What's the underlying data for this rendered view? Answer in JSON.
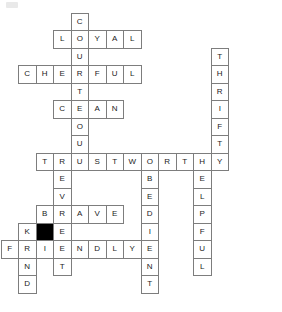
{
  "puzzle": {
    "title": "Scout Law Crossword Grid",
    "grid": {
      "cell_size": 17.5,
      "origin_x": 0.5,
      "origin_y": 12.5,
      "columns": 16,
      "rows": 17
    },
    "colors": {
      "cell_border": "#7d7d7d",
      "cell_fill": "#ffffff",
      "blocked_fill": "#000000",
      "letter": "#1b1b1b",
      "page_background": "#ffffff",
      "corner_mark": "#e9e9e9"
    },
    "entries": [
      {
        "id": "courteous-down",
        "answer": "COURTEOUS",
        "direction": "down",
        "row": 0,
        "col": 4
      },
      {
        "id": "loyal-across",
        "answer": "LOYAL",
        "direction": "across",
        "row": 1,
        "col": 3
      },
      {
        "id": "cheerful-across",
        "answer": "CHEERFUL",
        "direction": "across",
        "row": 3,
        "col": 1
      },
      {
        "id": "thrifty-down",
        "answer": "THRIFTY",
        "direction": "down",
        "row": 2,
        "col": 12
      },
      {
        "id": "clean-across",
        "answer": "CLEAN",
        "direction": "across",
        "row": 5,
        "col": 3
      },
      {
        "id": "trustworthy-across",
        "answer": "TRUSTWORTHY",
        "direction": "across",
        "row": 8,
        "col": 2
      },
      {
        "id": "event-down",
        "answer": "EVENT",
        "direction": "down",
        "row": 8,
        "col": 3
      },
      {
        "id": "obedient-down",
        "answer": "OBEDIENT",
        "direction": "down",
        "row": 8,
        "col": 8
      },
      {
        "id": "helpful-down",
        "answer": "HELPFUL",
        "direction": "down",
        "row": 8,
        "col": 11
      },
      {
        "id": "brave-across",
        "answer": "BRAVE",
        "direction": "across",
        "row": 11,
        "col": 2
      },
      {
        "id": "kind-down",
        "answer": "KIND",
        "direction": "down",
        "row": 12,
        "col": 1
      },
      {
        "id": "friendly-across",
        "answer": "FRIENDLY",
        "direction": "across",
        "row": 13,
        "col": 0
      }
    ],
    "blocked_cells": [
      {
        "row": 12,
        "col": 2
      }
    ],
    "letters": [
      {
        "row": 0,
        "col": 4,
        "letter": "C"
      },
      {
        "row": 1,
        "col": 3,
        "letter": "L"
      },
      {
        "row": 1,
        "col": 4,
        "letter": "O"
      },
      {
        "row": 1,
        "col": 5,
        "letter": "Y"
      },
      {
        "row": 1,
        "col": 6,
        "letter": "A"
      },
      {
        "row": 1,
        "col": 7,
        "letter": "L"
      },
      {
        "row": 2,
        "col": 4,
        "letter": "U"
      },
      {
        "row": 2,
        "col": 12,
        "letter": "T"
      },
      {
        "row": 3,
        "col": 1,
        "letter": "C"
      },
      {
        "row": 3,
        "col": 2,
        "letter": "H"
      },
      {
        "row": 3,
        "col": 3,
        "letter": "E"
      },
      {
        "row": 3,
        "col": 4,
        "letter": "R"
      },
      {
        "row": 3,
        "col": 5,
        "letter": "F"
      },
      {
        "row": 3,
        "col": 6,
        "letter": "U"
      },
      {
        "row": 3,
        "col": 7,
        "letter": "L"
      },
      {
        "row": 3,
        "col": 12,
        "letter": "H"
      },
      {
        "row": 4,
        "col": 4,
        "letter": "T"
      },
      {
        "row": 4,
        "col": 12,
        "letter": "R"
      },
      {
        "row": 5,
        "col": 3,
        "letter": "C"
      },
      {
        "row": 5,
        "col": 4,
        "letter": "E"
      },
      {
        "row": 5,
        "col": 5,
        "letter": "A"
      },
      {
        "row": 5,
        "col": 6,
        "letter": "N"
      },
      {
        "row": 5,
        "col": 12,
        "letter": "I"
      },
      {
        "row": 6,
        "col": 4,
        "letter": "O"
      },
      {
        "row": 6,
        "col": 12,
        "letter": "F"
      },
      {
        "row": 7,
        "col": 4,
        "letter": "U"
      },
      {
        "row": 7,
        "col": 12,
        "letter": "T"
      },
      {
        "row": 8,
        "col": 2,
        "letter": "T"
      },
      {
        "row": 8,
        "col": 3,
        "letter": "R"
      },
      {
        "row": 8,
        "col": 4,
        "letter": "U"
      },
      {
        "row": 8,
        "col": 5,
        "letter": "S"
      },
      {
        "row": 8,
        "col": 6,
        "letter": "T"
      },
      {
        "row": 8,
        "col": 7,
        "letter": "W"
      },
      {
        "row": 8,
        "col": 8,
        "letter": "O"
      },
      {
        "row": 8,
        "col": 9,
        "letter": "R"
      },
      {
        "row": 8,
        "col": 10,
        "letter": "T"
      },
      {
        "row": 8,
        "col": 11,
        "letter": "H"
      },
      {
        "row": 8,
        "col": 12,
        "letter": "Y"
      },
      {
        "row": 9,
        "col": 3,
        "letter": "E"
      },
      {
        "row": 9,
        "col": 8,
        "letter": "B"
      },
      {
        "row": 9,
        "col": 11,
        "letter": "E"
      },
      {
        "row": 10,
        "col": 3,
        "letter": "V"
      },
      {
        "row": 10,
        "col": 8,
        "letter": "E"
      },
      {
        "row": 10,
        "col": 11,
        "letter": "L"
      },
      {
        "row": 11,
        "col": 2,
        "letter": "B"
      },
      {
        "row": 11,
        "col": 3,
        "letter": "R"
      },
      {
        "row": 11,
        "col": 4,
        "letter": "A"
      },
      {
        "row": 11,
        "col": 5,
        "letter": "V"
      },
      {
        "row": 11,
        "col": 6,
        "letter": "E"
      },
      {
        "row": 11,
        "col": 8,
        "letter": "D"
      },
      {
        "row": 11,
        "col": 11,
        "letter": "P"
      },
      {
        "row": 12,
        "col": 1,
        "letter": "K"
      },
      {
        "row": 12,
        "col": 3,
        "letter": "E"
      },
      {
        "row": 12,
        "col": 8,
        "letter": "I"
      },
      {
        "row": 12,
        "col": 11,
        "letter": "F"
      },
      {
        "row": 13,
        "col": 0,
        "letter": "F"
      },
      {
        "row": 13,
        "col": 1,
        "letter": "R"
      },
      {
        "row": 13,
        "col": 2,
        "letter": "I"
      },
      {
        "row": 13,
        "col": 3,
        "letter": "E"
      },
      {
        "row": 13,
        "col": 4,
        "letter": "N"
      },
      {
        "row": 13,
        "col": 5,
        "letter": "D"
      },
      {
        "row": 13,
        "col": 6,
        "letter": "L"
      },
      {
        "row": 13,
        "col": 7,
        "letter": "Y"
      },
      {
        "row": 13,
        "col": 8,
        "letter": "E"
      },
      {
        "row": 13,
        "col": 11,
        "letter": "U"
      },
      {
        "row": 14,
        "col": 1,
        "letter": "N"
      },
      {
        "row": 14,
        "col": 3,
        "letter": "T"
      },
      {
        "row": 14,
        "col": 8,
        "letter": "N"
      },
      {
        "row": 14,
        "col": 11,
        "letter": "L"
      },
      {
        "row": 15,
        "col": 1,
        "letter": "D"
      },
      {
        "row": 15,
        "col": 8,
        "letter": "T"
      }
    ]
  }
}
